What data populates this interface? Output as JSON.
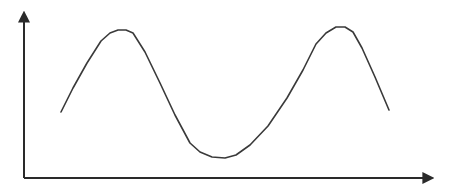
{
  "chart_data": {
    "type": "line",
    "title": "",
    "xlabel": "",
    "ylabel": "",
    "grid": false,
    "legend": null,
    "axes": {
      "x_arrow": true,
      "y_arrow": true,
      "ticks": false
    },
    "series": [
      {
        "name": "curve",
        "x": [
          0.0,
          0.1,
          0.15,
          0.2,
          0.25,
          0.3,
          0.4,
          0.5,
          0.55,
          0.6,
          0.7,
          0.8,
          0.85,
          0.9,
          0.95,
          1.0
        ],
        "values": [
          0.45,
          0.75,
          0.88,
          0.9,
          0.83,
          0.65,
          0.3,
          0.12,
          0.1,
          0.14,
          0.38,
          0.72,
          0.92,
          0.92,
          0.8,
          0.45
        ]
      }
    ],
    "points_px": [
      [
        61,
        112
      ],
      [
        73,
        88
      ],
      [
        87,
        63
      ],
      [
        101,
        41
      ],
      [
        110,
        33
      ],
      [
        118,
        30
      ],
      [
        126,
        30
      ],
      [
        133,
        33
      ],
      [
        145,
        52
      ],
      [
        160,
        83
      ],
      [
        175,
        115
      ],
      [
        190,
        143
      ],
      [
        200,
        152
      ],
      [
        212,
        157
      ],
      [
        225,
        158
      ],
      [
        236,
        155
      ],
      [
        250,
        145
      ],
      [
        268,
        126
      ],
      [
        287,
        98
      ],
      [
        303,
        70
      ],
      [
        316,
        44
      ],
      [
        326,
        33
      ],
      [
        336,
        27
      ],
      [
        345,
        27
      ],
      [
        353,
        32
      ],
      [
        362,
        48
      ],
      [
        375,
        77
      ],
      [
        389,
        110
      ]
    ],
    "colors": {
      "line": "#3a3a3a",
      "axes": "#2a2a2a",
      "background": "#ffffff"
    }
  }
}
